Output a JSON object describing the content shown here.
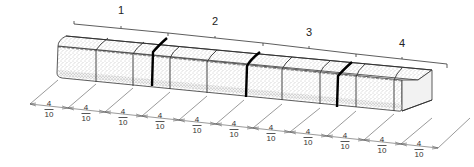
{
  "diagram": {
    "groups": [
      {
        "label": "1",
        "x": 121,
        "y": 10
      },
      {
        "label": "2",
        "x": 215,
        "y": 21
      },
      {
        "label": "3",
        "x": 309,
        "y": 31
      },
      {
        "label": "4",
        "x": 402,
        "y": 43
      }
    ],
    "dimensions": [
      {
        "num": "4",
        "den": "10",
        "x": 47,
        "y": 104
      },
      {
        "num": "4",
        "den": "10",
        "x": 85,
        "y": 108
      },
      {
        "num": "4",
        "den": "10",
        "x": 122,
        "y": 112
      },
      {
        "num": "4",
        "den": "10",
        "x": 160,
        "y": 116
      },
      {
        "num": "4",
        "den": "10",
        "x": 197,
        "y": 120
      },
      {
        "num": "4",
        "den": "10",
        "x": 233,
        "y": 124
      },
      {
        "num": "4",
        "den": "10",
        "x": 270,
        "y": 128
      },
      {
        "num": "4",
        "den": "10",
        "x": 308,
        "y": 132
      },
      {
        "num": "4",
        "den": "10",
        "x": 345,
        "y": 136
      },
      {
        "num": "4",
        "den": "10",
        "x": 382,
        "y": 140
      },
      {
        "num": "4",
        "den": "10",
        "x": 418,
        "y": 144
      }
    ],
    "colors": {
      "stipple": "#9a9a9a",
      "outline": "#333333",
      "crack": "#000000",
      "background": "#ffffff"
    }
  }
}
